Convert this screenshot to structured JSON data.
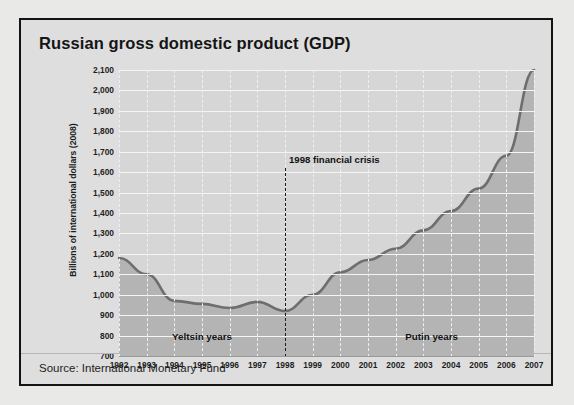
{
  "panel": {
    "title": "Russian gross domestic product (GDP)",
    "source": "Source: International Monetary Fund"
  },
  "chart_data": {
    "type": "area",
    "title": "Russian gross domestic product (GDP)",
    "xlabel": "",
    "ylabel": "Billions of international dollars (2008)",
    "categories": [
      "1992",
      "1993",
      "1994",
      "1995",
      "1996",
      "1997",
      "1998",
      "1999",
      "2000",
      "2001",
      "2002",
      "2003",
      "2004",
      "2005",
      "2006",
      "2007"
    ],
    "values": [
      1180,
      1100,
      970,
      955,
      935,
      965,
      920,
      1000,
      1110,
      1170,
      1225,
      1315,
      1410,
      1520,
      1680,
      2100
    ],
    "x": [
      1992,
      1993,
      1994,
      1995,
      1996,
      1997,
      1998,
      1999,
      2000,
      2001,
      2002,
      2003,
      2004,
      2005,
      2006,
      2007
    ],
    "ylim": [
      700,
      2100
    ],
    "xlim": [
      1992,
      2007
    ],
    "ytick_labels": [
      "2,100",
      "2,000",
      "1,900",
      "1,800",
      "1,700",
      "1,600",
      "1,500",
      "1,400",
      "1,300",
      "1,200",
      "1,100",
      "1,000",
      "900",
      "800",
      "700"
    ],
    "ytick_values": [
      2100,
      2000,
      1900,
      1800,
      1700,
      1600,
      1500,
      1400,
      1300,
      1200,
      1100,
      1000,
      900,
      800,
      700
    ],
    "grid": true,
    "legend": "none",
    "series_color": "#6e6e6e",
    "area_color": "#b4b4b4",
    "plot_background": "#d6d6d6",
    "gridline_color": "#f4f4f4",
    "annotations": [
      {
        "name": "crisis-marker",
        "label": "1998 financial crisis",
        "x": 1998,
        "style": "vertical-dashed-line"
      },
      {
        "name": "era-yeltsin",
        "label": "Yeltsin years",
        "x": 1995,
        "y": 820
      },
      {
        "name": "era-putin",
        "label": "Putin years",
        "x": 2003.3,
        "y": 820
      }
    ]
  }
}
